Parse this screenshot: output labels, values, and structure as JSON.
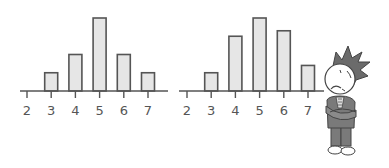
{
  "chart_data": [
    {
      "type": "bar",
      "title": "",
      "xlabel": "",
      "ylabel": "",
      "categories": [
        "2",
        "3",
        "4",
        "5",
        "6",
        "7"
      ],
      "values": [
        0,
        1,
        2,
        4,
        2,
        1
      ],
      "grid": false,
      "legend": null
    },
    {
      "type": "bar",
      "title": "",
      "xlabel": "",
      "ylabel": "",
      "categories": [
        "2",
        "3",
        "4",
        "5",
        "6",
        "7"
      ],
      "values": [
        0,
        1,
        3,
        4,
        3.3,
        1.4
      ],
      "grid": false,
      "legend": null
    }
  ],
  "charts": [
    {
      "x_origin": 20,
      "axis_end": 168,
      "tick_start": 27,
      "tick_step": 24.2,
      "baseline": 91,
      "unit": 18.25,
      "bar_width": 13
    },
    {
      "x_origin": 179,
      "axis_end": 324,
      "tick_start": 187,
      "tick_step": 24.2,
      "baseline": 91,
      "unit": 18.25,
      "bar_width": 13
    }
  ],
  "character": {
    "description": "worried cartoon man with spiky hair, arms crossed"
  },
  "colors": {
    "bar_fill": "#e6e6e6",
    "stroke": "#555555",
    "hair": "#6b6b6b",
    "suit": "#7a7a7a"
  }
}
